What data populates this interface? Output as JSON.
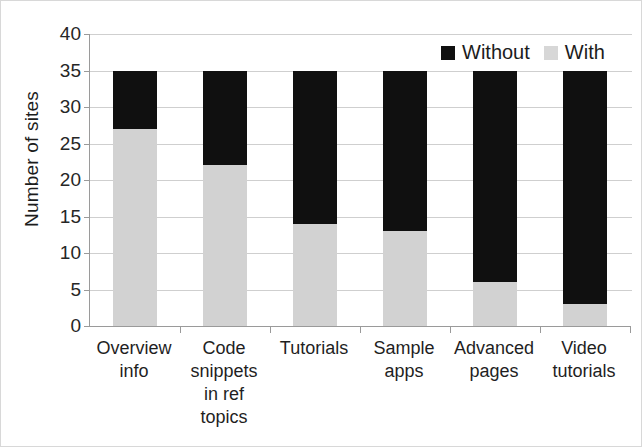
{
  "chart_data": {
    "type": "bar",
    "subtype": "stacked-vertical",
    "title": "",
    "xlabel": "",
    "ylabel": "Number of sites",
    "ylim": [
      0,
      40
    ],
    "ytick_step": 5,
    "yticks": [
      0,
      5,
      10,
      15,
      20,
      25,
      30,
      35,
      40
    ],
    "ytick_labels": [
      "0",
      "5",
      "10",
      "15",
      "20",
      "25",
      "30",
      "35",
      "40"
    ],
    "grid": true,
    "grid_axis": "y",
    "legend_position": "top-right",
    "categories": [
      "Overview info",
      "Code snippets in ref topics",
      "Tutorials",
      "Sample apps",
      "Advanced pages",
      "Video tutorials"
    ],
    "category_label_lines": [
      [
        "Overview",
        "info"
      ],
      [
        "Code",
        "snippets",
        "in ref",
        "topics"
      ],
      [
        "Tutorials"
      ],
      [
        "Sample",
        "apps"
      ],
      [
        "Advanced",
        "pages"
      ],
      [
        "Video",
        "tutorials"
      ]
    ],
    "series": [
      {
        "name": "With",
        "color": "#d2d2d2",
        "values": [
          27,
          22,
          14,
          13,
          6,
          3
        ]
      },
      {
        "name": "Without",
        "color": "#101010",
        "values": [
          8,
          13,
          21,
          22,
          29,
          32
        ]
      }
    ],
    "totals": [
      35,
      35,
      35,
      35,
      35,
      35
    ],
    "stack_order_bottom_to_top": [
      "With",
      "Without"
    ]
  },
  "legend": {
    "entries": [
      {
        "label": "Without",
        "color": "#101010"
      },
      {
        "label": "With",
        "color": "#d7d7d7"
      }
    ]
  },
  "axis": {
    "y_title": "Number of sites"
  }
}
